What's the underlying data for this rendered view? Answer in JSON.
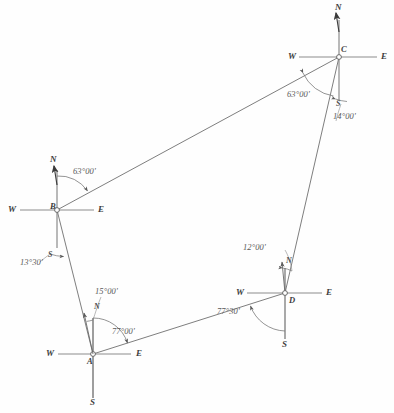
{
  "figure": {
    "stroke_color": "#6b6b6b",
    "text_color": "#4a4a4a",
    "background": "#ffffff",
    "caption": ""
  },
  "stations": [
    {
      "id": "A",
      "label": "A",
      "x": 93,
      "y": 354,
      "cardinals": {
        "north": "N",
        "south": "S",
        "east": "E",
        "west": "W"
      }
    },
    {
      "id": "B",
      "label": "B",
      "x": 57,
      "y": 210,
      "cardinals": {
        "north": "N",
        "south": "S",
        "east": "E",
        "west": "W"
      }
    },
    {
      "id": "C",
      "label": "C",
      "x": 339,
      "y": 57,
      "cardinals": {
        "north": "N",
        "south": "S",
        "east": "E",
        "west": "W"
      }
    },
    {
      "id": "D",
      "label": "D",
      "x": 285,
      "y": 293,
      "cardinals": {
        "north": "N",
        "south": "S",
        "east": "E",
        "west": "W"
      }
    }
  ],
  "angle_labels": [
    {
      "id": "angle-c-nw",
      "text": "63°00'",
      "x": 287,
      "y": 95
    },
    {
      "id": "angle-c-se",
      "text": "14°00'",
      "x": 334,
      "y": 117
    },
    {
      "id": "angle-b-ne",
      "text": "63°00'",
      "x": 74,
      "y": 172
    },
    {
      "id": "angle-b-sw",
      "text": "13°30'",
      "x": 21,
      "y": 262
    },
    {
      "id": "angle-a-n",
      "text": "15°00'",
      "x": 95,
      "y": 291
    },
    {
      "id": "angle-a-e",
      "text": "77°00'",
      "x": 111,
      "y": 331
    },
    {
      "id": "angle-d-n",
      "text": "12°00'",
      "x": 243,
      "y": 247
    },
    {
      "id": "angle-d-sw",
      "text": "77°30'",
      "x": 218,
      "y": 311
    }
  ],
  "traverse_legs": [
    {
      "from": "A",
      "to": "B",
      "name": "leg-ab"
    },
    {
      "from": "B",
      "to": "C",
      "name": "leg-bc"
    },
    {
      "from": "C",
      "to": "D",
      "name": "leg-cd"
    },
    {
      "from": "D",
      "to": "A",
      "name": "leg-da"
    }
  ],
  "local_meridians": [
    {
      "at": "A",
      "label": "N",
      "x": 94,
      "y": 304
    },
    {
      "at": "D",
      "label": "N",
      "x": 288,
      "y": 258
    },
    {
      "at": "B",
      "label": "S",
      "x": 48,
      "y": 252
    },
    {
      "at": "C",
      "label": "S",
      "x": 344,
      "y": 110
    }
  ]
}
